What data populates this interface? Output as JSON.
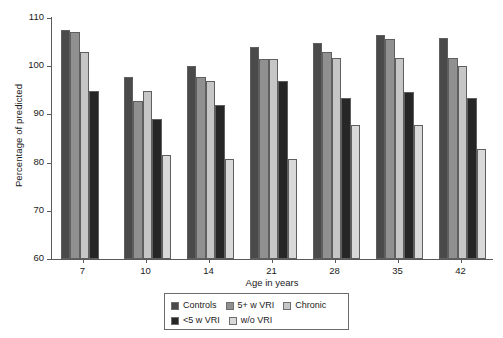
{
  "chart_data": {
    "type": "bar",
    "title": "",
    "xlabel": "Age in years",
    "ylabel": "Percentage of predicted",
    "categories": [
      "7",
      "10",
      "14",
      "21",
      "28",
      "35",
      "42"
    ],
    "ylim": [
      60,
      110
    ],
    "yticks": [
      60,
      70,
      80,
      90,
      100,
      110
    ],
    "grid": false,
    "legend_position": "bottom-center",
    "series": [
      {
        "name": "Controls",
        "color": "#4a4a4a",
        "values": [
          107.6,
          97.8,
          100.0,
          104.0,
          104.9,
          106.4,
          105.8
        ]
      },
      {
        "name": "5+ w VRI",
        "color": "#909090",
        "values": [
          107.0,
          92.8,
          97.8,
          101.6,
          103.0,
          105.7,
          101.7
        ]
      },
      {
        "name": "Chronic",
        "color": "#c6c6c6",
        "values": [
          102.9,
          94.8,
          97.0,
          101.5,
          101.8,
          101.7,
          100.0
        ]
      },
      {
        "name": "<5 w VRI",
        "color": "#262626",
        "values": [
          94.8,
          89.0,
          92.0,
          97.0,
          93.5,
          94.7,
          93.5
        ]
      },
      {
        "name": "w/o VRI",
        "color": "#d9d9d9",
        "values": [
          null,
          81.6,
          80.8,
          80.8,
          87.8,
          87.8,
          82.8
        ]
      }
    ]
  },
  "legend": {
    "row1": [
      "Controls",
      "5+ w VRI",
      "Chronic"
    ],
    "row2": [
      "<5 w VRI",
      "w/o VRI"
    ]
  }
}
